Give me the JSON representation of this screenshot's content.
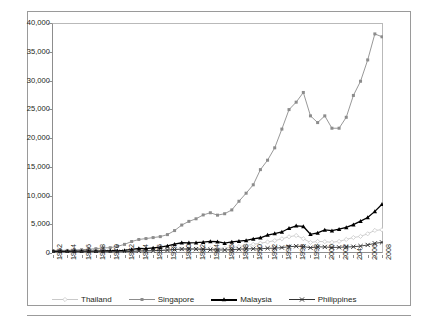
{
  "chart_data": {
    "type": "line",
    "title": "",
    "subtitle": "",
    "xlabel": "",
    "ylabel": "",
    "ylim": [
      0,
      40000
    ],
    "ytick_values": [
      0,
      5000,
      10000,
      15000,
      20000,
      25000,
      30000,
      35000,
      40000
    ],
    "ytick_labels": [
      "0",
      "5,000",
      "10,000",
      "15,000",
      "20,000",
      "25,000",
      "30,000",
      "35,000",
      "40,000"
    ],
    "grid": false,
    "legend_position": "bottom",
    "x": [
      1962,
      1963,
      1964,
      1965,
      1966,
      1967,
      1968,
      1969,
      1970,
      1971,
      1972,
      1973,
      1974,
      1975,
      1976,
      1977,
      1978,
      1979,
      1980,
      1981,
      1982,
      1983,
      1984,
      1985,
      1986,
      1987,
      1988,
      1989,
      1990,
      1991,
      1992,
      1993,
      1994,
      1995,
      1996,
      1997,
      1998,
      1999,
      2000,
      2001,
      2002,
      2003,
      2004,
      2005,
      2006,
      2007,
      2008
    ],
    "xtick_labels": [
      "1962",
      "1964",
      "1966",
      "1968",
      "1970",
      "1972",
      "1974",
      "1976",
      "1978",
      "1980",
      "1982",
      "1984",
      "1986",
      "1988",
      "1990",
      "1992",
      "1994",
      "1996",
      "1998",
      "2000",
      "2002",
      "204",
      "2006",
      "2008"
    ],
    "series": [
      {
        "name": "Thailand",
        "color": "#c9c9c9",
        "marker": "diamond",
        "values": [
          101,
          110,
          118,
          126,
          142,
          152,
          161,
          172,
          192,
          196,
          216,
          268,
          330,
          350,
          386,
          440,
          527,
          600,
          683,
          726,
          747,
          786,
          810,
          750,
          830,
          960,
          1120,
          1280,
          1510,
          1700,
          1920,
          2150,
          2470,
          2820,
          3040,
          2490,
          1830,
          2010,
          1970,
          1860,
          2030,
          2360,
          2690,
          2890,
          3340,
          3930,
          4040
        ]
      },
      {
        "name": "Singapore",
        "color": "#8c8c8c",
        "marker": "square",
        "values": [
          428,
          462,
          450,
          517,
          572,
          650,
          750,
          880,
          925,
          1150,
          1500,
          2000,
          2350,
          2510,
          2680,
          2850,
          3200,
          3900,
          4860,
          5500,
          5950,
          6620,
          7000,
          6580,
          6830,
          7490,
          9000,
          10400,
          11860,
          14500,
          16140,
          18290,
          21550,
          24940,
          26230,
          27920,
          23850,
          22680,
          23850,
          21700,
          21700,
          23600,
          27400,
          29870,
          33580,
          38100,
          37600
        ]
      },
      {
        "name": "Malaysia",
        "color": "#000000",
        "marker": "triangle",
        "values": [
          286,
          292,
          296,
          315,
          320,
          327,
          331,
          354,
          387,
          397,
          455,
          620,
          780,
          770,
          880,
          1010,
          1230,
          1530,
          1780,
          1770,
          1810,
          1880,
          2020,
          1960,
          1710,
          1920,
          2060,
          2180,
          2440,
          2650,
          3120,
          3380,
          3660,
          4300,
          4730,
          4620,
          3250,
          3500,
          4030,
          3880,
          4160,
          4460,
          4940,
          5550,
          6180,
          7240,
          8470
        ]
      },
      {
        "name": "Philippines",
        "color": "#333333",
        "marker": "x",
        "values": [
          155,
          158,
          162,
          168,
          178,
          190,
          200,
          211,
          192,
          212,
          227,
          283,
          350,
          370,
          405,
          450,
          510,
          600,
          685,
          700,
          675,
          640,
          580,
          530,
          530,
          580,
          660,
          730,
          730,
          720,
          830,
          830,
          945,
          1090,
          1180,
          1130,
          910,
          1070,
          1050,
          960,
          990,
          1040,
          1090,
          1200,
          1400,
          1680,
          1850
        ]
      }
    ]
  },
  "legend": {
    "items": [
      {
        "label": "Thailand"
      },
      {
        "label": "Singapore"
      },
      {
        "label": "Malaysia"
      },
      {
        "label": "Philippines"
      }
    ]
  }
}
